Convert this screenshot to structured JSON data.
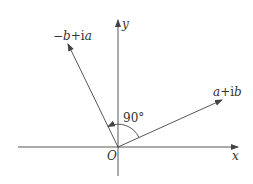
{
  "diagram": {
    "axes": {
      "x_label": "x",
      "y_label": "y",
      "origin_label": "O"
    },
    "vectors": [
      {
        "name": "a+ib",
        "label_parts": [
          {
            "text": "a",
            "italic": true
          },
          {
            "text": "+i",
            "italic": false
          },
          {
            "text": "b",
            "italic": true
          }
        ],
        "direction": [
          2,
          1
        ]
      },
      {
        "name": "-b+ia",
        "label_parts": [
          {
            "text": "−",
            "italic": false
          },
          {
            "text": "b",
            "italic": true
          },
          {
            "text": "+i",
            "italic": false
          },
          {
            "text": "a",
            "italic": true
          }
        ],
        "direction": [
          -1,
          2
        ]
      }
    ],
    "angle_label": "90°",
    "colors": {
      "line": "#444444",
      "text": "#333333"
    }
  }
}
